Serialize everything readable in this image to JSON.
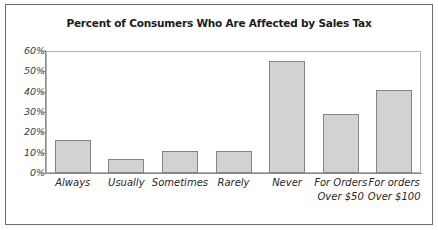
{
  "figure": {
    "title": "Percent of Consumers Who Are Affected by Sales Tax",
    "frame_color": "#6d6d6d",
    "background": "#ffffff"
  },
  "chart_data": {
    "type": "bar",
    "title": "Percent of Consumers Who Are Affected by Sales Tax",
    "xlabel": "",
    "ylabel": "",
    "ylim": [
      0,
      60
    ],
    "ytick_labels": [
      "0%",
      "10%",
      "20%",
      "30%",
      "40%",
      "50%",
      "60%"
    ],
    "ytick_values": [
      0,
      10,
      20,
      30,
      40,
      50,
      60
    ],
    "grid": false,
    "legend": "none",
    "bar_fill_color": "#d2d2d2",
    "bar_border_color": "#848484",
    "categories": [
      "Always",
      "Usually",
      "Sometimes",
      "Rarely",
      "Never",
      "For Orders Over $50",
      "For orders Over $100"
    ],
    "category_lines": [
      [
        "Always"
      ],
      [
        "Usually"
      ],
      [
        "Sometimes"
      ],
      [
        "Rarely"
      ],
      [
        "Never"
      ],
      [
        "For Orders",
        "Over $50"
      ],
      [
        "For orders",
        "Over $100"
      ]
    ],
    "values": [
      16,
      7,
      11,
      11,
      55,
      29,
      41
    ],
    "value_labels": [
      "16%",
      "7%",
      "11%",
      "11%",
      "55%",
      "29%",
      "41%"
    ]
  }
}
